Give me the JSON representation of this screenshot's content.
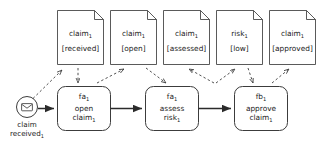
{
  "diagram": {
    "colors": {
      "stroke": "#3c3c3c",
      "text": "#1a1a1a",
      "background": "#ffffff"
    },
    "start_event": {
      "icon": "envelope-icon",
      "label_line1": "claim",
      "label_line2": "received",
      "label_line2_sub": "1"
    },
    "documents": [
      {
        "name_base": "claim",
        "name_sub": "1",
        "state": "[received]"
      },
      {
        "name_base": "claim",
        "name_sub": "1",
        "state": "[open]"
      },
      {
        "name_base": "claim",
        "name_sub": "1",
        "state": "[assessed]"
      },
      {
        "name_base": "risk",
        "name_sub": "1",
        "state": "[low]"
      },
      {
        "name_base": "claim",
        "name_sub": "1",
        "state": "[approved]"
      }
    ],
    "activities": [
      {
        "id_base": "fa",
        "id_sub": "1",
        "verb": "open",
        "object_base": "claim",
        "object_sub": "1"
      },
      {
        "id_base": "fa",
        "id_sub": "1",
        "verb": "assess",
        "object_base": "risk",
        "object_sub": "1"
      },
      {
        "id_base": "fb",
        "id_sub": "1",
        "verb": "approve",
        "object_base": "claim",
        "object_sub": "1"
      }
    ]
  }
}
